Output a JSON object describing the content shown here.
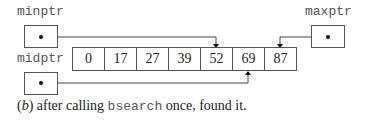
{
  "pointers": {
    "minptr": {
      "label": "minptr",
      "target_index": 4
    },
    "midptr": {
      "label": "midptr",
      "target_index": 5
    },
    "maxptr": {
      "label": "maxptr",
      "target_index": 6
    }
  },
  "array": {
    "values": [
      "0",
      "17",
      "27",
      "39",
      "52",
      "69",
      "87"
    ]
  },
  "caption": {
    "prefix_open": "(",
    "part_label": "b",
    "prefix_close": ")",
    "text_before": " after calling ",
    "code": "bsearch",
    "text_after": " once, found it."
  }
}
